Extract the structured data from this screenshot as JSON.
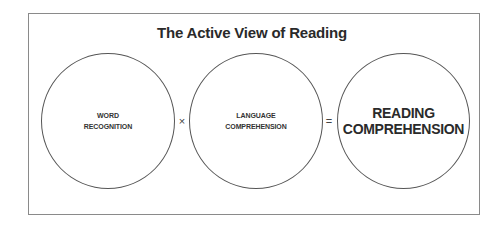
{
  "diagram": {
    "title": "The Active View of Reading",
    "components": [
      {
        "id": "word-recognition",
        "label_lines": [
          "WORD",
          "RECOGNITION"
        ]
      },
      {
        "id": "language-comprehension",
        "label_lines": [
          "LANGUAGE",
          "COMPREHENSION"
        ]
      },
      {
        "id": "reading-comprehension",
        "label_lines": [
          "READING",
          "COMPREHENSION"
        ]
      }
    ],
    "operators": {
      "times": "×",
      "equals": "="
    },
    "colors": {
      "frame_border": "#8a8a8a",
      "circle_border": "#555555",
      "text": "#2a2a2a",
      "background": "#ffffff"
    }
  }
}
